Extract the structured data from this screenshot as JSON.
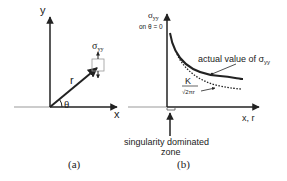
{
  "panel_a": {
    "caption": "(a)",
    "y_label": "y",
    "x_label": "x",
    "r_label": "r",
    "theta_label": "θ",
    "stress_label": "σ",
    "stress_sub": "yy"
  },
  "panel_b": {
    "caption": "(b)",
    "y_label": "σ",
    "y_sub": "yy",
    "y_note": "on θ = 0",
    "x_label": "x, r",
    "actual_label": "actual value of σ",
    "actual_sub": "yy",
    "k_num": "K",
    "k_den": "√2πr",
    "zone_line1": "singularity dominated",
    "zone_line2": "zone"
  },
  "colors": {
    "ink": "#222222",
    "crack": "#bbbbbb"
  }
}
